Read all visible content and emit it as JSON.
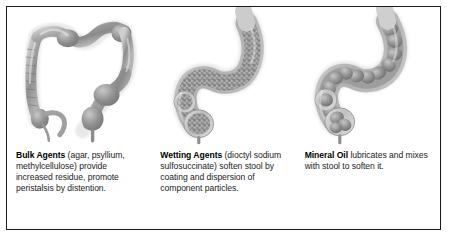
{
  "figure": {
    "border_color": "#1a1a1a",
    "background_color": "#ffffff",
    "ink_color": "#7d7d7d"
  },
  "panels": [
    {
      "id": "bulk-agents",
      "illustration_name": "large-intestine-colon-normal-illustration",
      "illustration_alt": "Grayscale anatomical illustration of the entire large intestine showing ascending, transverse, descending and sigmoid colon with haustra, cecum and appendix",
      "term": "Bulk Agents",
      "body": " (agar, psyllium, methylcellulose) provide increased residue, promote peristalsis by distention."
    },
    {
      "id": "wetting-agents",
      "illustration_name": "sigmoid-colon-rectum-granular-stool-illustration",
      "illustration_alt": "Grayscale anatomical illustration of the sigmoid colon and rectum filled with finely granular, softened stool",
      "term": "Wetting Agents",
      "body": " (dioctyl sodium sulfosuccinate) soften stool by coating and dispersion of component particles."
    },
    {
      "id": "mineral-oil",
      "illustration_name": "sigmoid-colon-rectum-lumpy-stool-illustration",
      "illustration_alt": "Grayscale anatomical illustration of the sigmoid colon and rectum containing lubricated lumpy stool masses",
      "term": "Mineral Oil",
      "body": " lubricates and mixes with stool to soften it."
    }
  ]
}
